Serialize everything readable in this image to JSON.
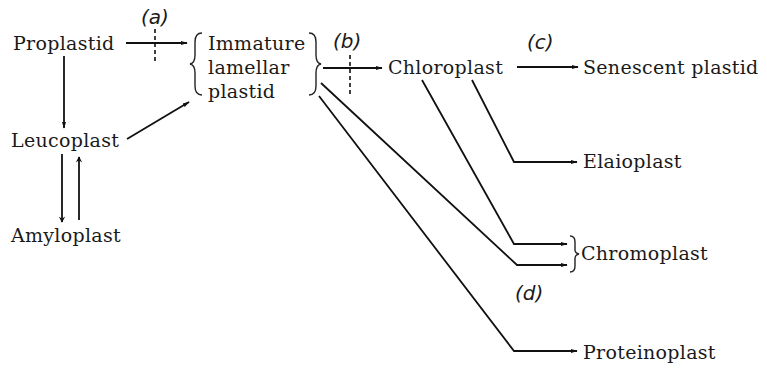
{
  "diagram": {
    "nodes": {
      "proplastid": "Proplastid",
      "immature_lines": [
        "Immature",
        "lamellar",
        "plastid"
      ],
      "leucoplast": "Leucoplast",
      "amyloplast": "Amyloplast",
      "chloroplast": "Chloroplast",
      "senescent": "Senescent plastid",
      "elaioplast": "Elaioplast",
      "chromoplast": "Chromoplast",
      "proteinoplast": "Proteinoplast"
    },
    "labels": {
      "a": "(a)",
      "b": "(b)",
      "c": "(c)",
      "d": "(d)"
    },
    "edges": [
      {
        "from": "Proplastid",
        "to": "Immature lamellar plastid",
        "blocked": true,
        "label": "(a)"
      },
      {
        "from": "Proplastid",
        "to": "Leucoplast"
      },
      {
        "from": "Leucoplast",
        "to": "Immature lamellar plastid"
      },
      {
        "from": "Leucoplast",
        "to": "Amyloplast"
      },
      {
        "from": "Amyloplast",
        "to": "Leucoplast"
      },
      {
        "from": "Immature lamellar plastid",
        "to": "Chloroplast",
        "blocked": true,
        "label": "(b)"
      },
      {
        "from": "Chloroplast",
        "to": "Senescent plastid",
        "label": "(c)"
      },
      {
        "from": "Chloroplast",
        "to": "Elaioplast"
      },
      {
        "from": "Chloroplast",
        "to": "Chromoplast"
      },
      {
        "from": "Immature lamellar plastid",
        "to": "Chromoplast",
        "label": "(d)"
      },
      {
        "from": "Immature lamellar plastid",
        "to": "Proteinoplast"
      }
    ]
  }
}
